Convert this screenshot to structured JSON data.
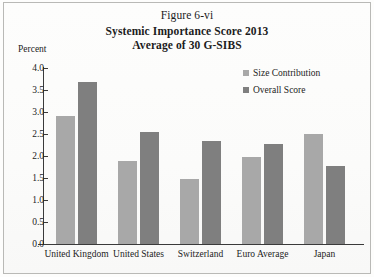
{
  "figure_label": "Figure 6-vi",
  "title_lines": [
    "Systemic Importance Score 2013",
    "Average of 30 G-SIBS"
  ],
  "axis_unit_label": "Percent",
  "colors": {
    "size_contribution": "#a8a8a8",
    "overall_score": "#7f7f7f",
    "axis": "#3a3a3a",
    "page_background": "#fdfdfc",
    "frame_border": "#b9b9b6"
  },
  "chart_data": {
    "type": "bar",
    "title": "Systemic Importance Score 2013 Average of 30 G-SIBS",
    "subtitle": "Figure 6-vi",
    "xlabel": "",
    "ylabel": "Percent",
    "ylim": [
      0.0,
      4.0
    ],
    "yticks": [
      "0.0",
      "0.5",
      "1.0",
      "1.5",
      "2.0",
      "2.5",
      "3.0",
      "3.5",
      "4.0"
    ],
    "ytick_values": [
      0.0,
      0.5,
      1.0,
      1.5,
      2.0,
      2.5,
      3.0,
      3.5,
      4.0
    ],
    "grid": false,
    "legend_position": "upper-right",
    "categories": [
      "United Kingdom",
      "United States",
      "Switzerland",
      "Euro Average",
      "Japan"
    ],
    "series": [
      {
        "name": "Size Contribution",
        "color": "#a8a8a8",
        "values": [
          2.9,
          1.88,
          1.47,
          1.98,
          2.5
        ]
      },
      {
        "name": "Overall Score",
        "color": "#7f7f7f",
        "values": [
          3.68,
          2.55,
          2.35,
          2.27,
          1.77
        ]
      }
    ]
  }
}
